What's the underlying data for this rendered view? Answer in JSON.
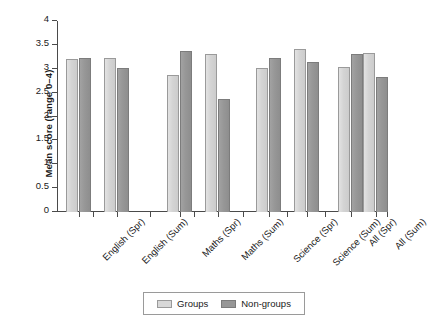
{
  "chart_data": {
    "type": "bar",
    "title": "",
    "xlabel": "",
    "ylabel": "Mean score (range 0–4)",
    "ylim": [
      0,
      4
    ],
    "ytick_labels": [
      "0",
      "0.5",
      "1",
      "1.5",
      "2",
      "2.5",
      "3",
      "3.5",
      "4"
    ],
    "ytick_values": [
      0,
      0.5,
      1,
      1.5,
      2,
      2.5,
      3,
      3.5,
      4
    ],
    "grid": false,
    "legend_position": "bottom",
    "categories": [
      "English (Spr)",
      "English (Sum)",
      "Maths (Spr)",
      "Maths (Sum)",
      "Science (Spr)",
      "Science (Sum)",
      "All (Spr)",
      "All (Sum)"
    ],
    "series": [
      {
        "name": "Groups",
        "color": "#d4d4d4",
        "values": [
          3.2,
          3.22,
          2.86,
          3.31,
          3.02,
          3.42,
          3.03,
          3.33
        ]
      },
      {
        "name": "Non-groups",
        "color": "#979797",
        "values": [
          3.22,
          3.01,
          3.38,
          2.37,
          3.22,
          3.15,
          3.31,
          2.82
        ]
      }
    ]
  },
  "legend": {
    "items": [
      {
        "label": "Groups",
        "swatch": "groups"
      },
      {
        "label": "Non-groups",
        "swatch": "nongroups"
      }
    ]
  }
}
